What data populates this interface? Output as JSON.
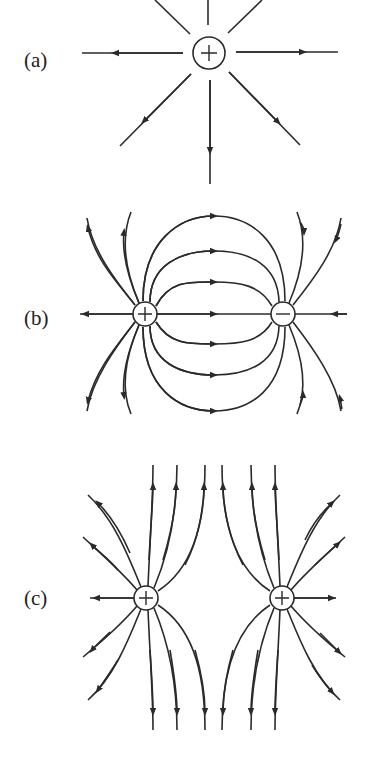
{
  "figure": {
    "panels": [
      {
        "label": "(a)",
        "description": "Field lines of a single positive charge",
        "charges": [
          "+"
        ]
      },
      {
        "label": "(b)",
        "description": "Field lines of an electric dipole",
        "charges": [
          "+",
          "−"
        ]
      },
      {
        "label": "(c)",
        "description": "Field lines of two equal positive charges",
        "charges": [
          "+",
          "+"
        ]
      }
    ],
    "colors": {
      "line": "#2a2a2a",
      "background": "#ffffff"
    }
  }
}
